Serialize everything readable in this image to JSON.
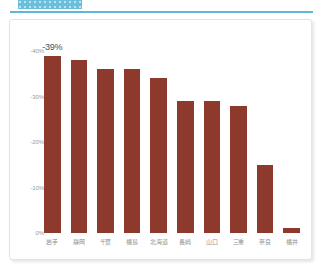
{
  "header": {
    "block_color": "#6cbedd",
    "rule_color": "#5fb6d8"
  },
  "card": {
    "background": "#ffffff",
    "border_color": "#e3e3e3"
  },
  "chart_data": {
    "type": "bar",
    "title": "",
    "subtitle": "",
    "xlabel": "",
    "ylabel": "",
    "grid": false,
    "legend": "none",
    "bar_color": "#8d392c",
    "ylim": [
      -40,
      0
    ],
    "yticks": [
      -40,
      -30,
      -20,
      -10,
      0
    ],
    "ytick_labels": [
      "-40%",
      "-30%",
      "-20%",
      "-10%",
      "0%"
    ],
    "categories": [
      "岩手",
      "静岡",
      "千葉",
      "福島",
      "北海道",
      "長崎",
      "山口",
      "三重",
      "奈良",
      "福井"
    ],
    "values": [
      -39,
      -38,
      -36,
      -36,
      -34,
      -29,
      -29,
      -28,
      -15,
      -1
    ],
    "annotations": [
      {
        "index": 0,
        "text": "-39%"
      }
    ]
  }
}
